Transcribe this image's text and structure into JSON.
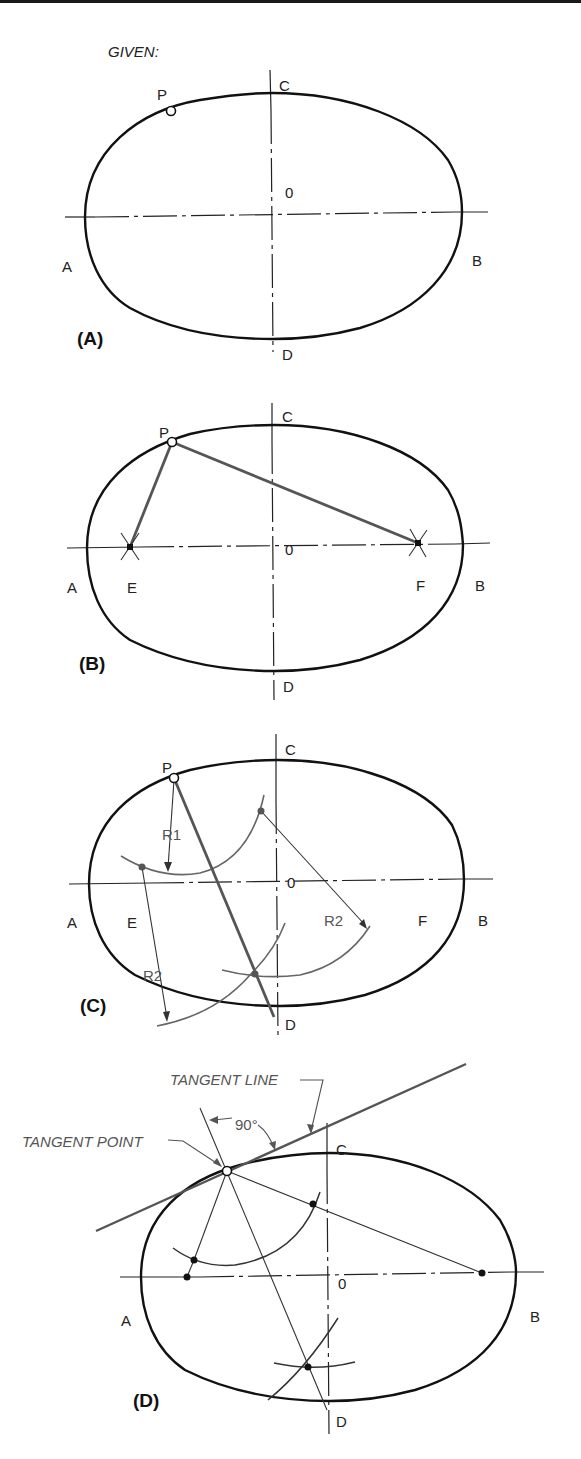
{
  "header": {
    "given_label": "GIVEN:"
  },
  "panels": [
    {
      "id": "A",
      "label": "(A)",
      "points": {
        "P": "P",
        "C": "C",
        "O": "0",
        "A": "A",
        "B": "B",
        "D": "D"
      }
    },
    {
      "id": "B",
      "label": "(B)",
      "points": {
        "P": "P",
        "C": "C",
        "O": "0",
        "A": "A",
        "B": "B",
        "D": "D",
        "E": "E",
        "F": "F"
      }
    },
    {
      "id": "C",
      "label": "(C)",
      "points": {
        "P": "P",
        "C": "C",
        "O": "0",
        "A": "A",
        "B": "B",
        "D": "D",
        "E": "E",
        "F": "F"
      },
      "radii": {
        "r1": "R1",
        "r2_right": "R2",
        "r2_left": "R2"
      }
    },
    {
      "id": "D",
      "label": "(D)",
      "points": {
        "C": "C",
        "O": "0",
        "A": "A",
        "B": "B",
        "D": "D"
      },
      "annotations": {
        "tangent_line": "TANGENT LINE",
        "tangent_point": "TANGENT POINT",
        "angle": "90°"
      }
    }
  ],
  "colors": {
    "outline": "#111111",
    "construction": "#555555",
    "background": "#ffffff"
  }
}
